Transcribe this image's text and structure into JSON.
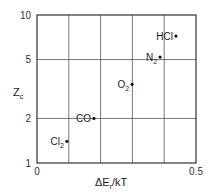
{
  "chart_data": {
    "type": "scatter",
    "title": "",
    "xlabel": "ΔE",
    "xlabel_sub": "r",
    "xlabel_tail": "/kT",
    "ylabel": "Z",
    "ylabel_sub": "c",
    "xlim": [
      0,
      0.5
    ],
    "ylim": [
      1,
      10
    ],
    "yscale": "log",
    "grid": true,
    "x_ticks": [
      0,
      0.1,
      0.2,
      0.3,
      0.4,
      0.5
    ],
    "x_tick_labels": [
      {
        "value": 0,
        "label": "0"
      },
      {
        "value": 0.5,
        "label": "0.5"
      }
    ],
    "y_ticks": [
      1,
      2,
      5,
      10
    ],
    "y_tick_labels": [
      {
        "value": 1,
        "label": "1"
      },
      {
        "value": 2,
        "label": "2"
      },
      {
        "value": 5,
        "label": "5"
      },
      {
        "value": 10,
        "label": "10"
      }
    ],
    "points": [
      {
        "name": "HCl",
        "base": "HCl",
        "sub": "",
        "x": 0.437,
        "y": 7.2
      },
      {
        "name": "N2",
        "base": "N",
        "sub": "2",
        "x": 0.387,
        "y": 5.2
      },
      {
        "name": "O2",
        "base": "O",
        "sub": "2",
        "x": 0.299,
        "y": 3.4
      },
      {
        "name": "CO",
        "base": "CO",
        "sub": "",
        "x": 0.179,
        "y": 2.0
      },
      {
        "name": "Cl2",
        "base": "Cl",
        "sub": "2",
        "x": 0.094,
        "y": 1.4
      }
    ],
    "colors": {
      "axis": "#333333",
      "grid": "#555555",
      "point": "#111111"
    }
  }
}
